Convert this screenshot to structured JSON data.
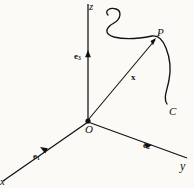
{
  "figure": {
    "kind": "3d-coordinate-system-diagram",
    "background_color": "#fbfaf7",
    "stroke_color": "#111111",
    "labels": {
      "z_axis": "z",
      "y_axis": "y",
      "x_axis": "x",
      "origin": "O",
      "point": "P",
      "curve": "C",
      "basis_e1": "e",
      "basis_e1_sub": "1",
      "basis_e2": "e",
      "basis_e2_sub": "2",
      "basis_e3": "e",
      "basis_e3_sub": "3",
      "position_vector": "x"
    }
  }
}
